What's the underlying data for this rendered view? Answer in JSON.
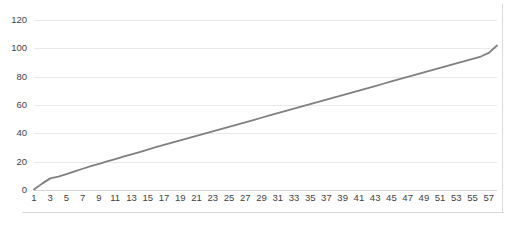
{
  "chart_data": {
    "type": "line",
    "title": "",
    "subtitle": "",
    "xlabel": "",
    "ylabel": "",
    "grid": true,
    "legend": false,
    "legend_position": "none",
    "ylim": [
      0,
      120
    ],
    "yticks": [
      0,
      20,
      40,
      60,
      80,
      100,
      120
    ],
    "ytick_labels": [
      "0",
      "20",
      "40",
      "60",
      "80",
      "100",
      "120"
    ],
    "xlim": [
      1,
      58
    ],
    "xticks": [
      1,
      3,
      5,
      7,
      9,
      11,
      13,
      15,
      17,
      19,
      21,
      23,
      25,
      27,
      29,
      31,
      33,
      35,
      37,
      39,
      41,
      43,
      45,
      47,
      49,
      51,
      53,
      55,
      57
    ],
    "xtick_labels": [
      "1",
      "3",
      "5",
      "7",
      "9",
      "11",
      "13",
      "15",
      "17",
      "19",
      "21",
      "23",
      "25",
      "27",
      "29",
      "31",
      "33",
      "35",
      "37",
      "39",
      "41",
      "43",
      "45",
      "47",
      "49",
      "51",
      "53",
      "55",
      "57"
    ],
    "series": [
      {
        "name": "Series 1",
        "color": "#808080",
        "line_width": 1.8,
        "markers": false,
        "x": [
          1,
          2,
          3,
          4,
          5,
          6,
          7,
          8,
          9,
          10,
          11,
          12,
          13,
          14,
          15,
          16,
          17,
          18,
          19,
          20,
          21,
          22,
          23,
          24,
          25,
          26,
          27,
          28,
          29,
          30,
          31,
          32,
          33,
          34,
          35,
          36,
          37,
          38,
          39,
          40,
          41,
          42,
          43,
          44,
          45,
          46,
          47,
          48,
          49,
          50,
          51,
          52,
          53,
          54,
          55,
          56,
          57,
          58
        ],
        "values": [
          0.3,
          4.5,
          8.2,
          9.5,
          11.2,
          13.2,
          15.0,
          16.8,
          18.5,
          20.2,
          21.8,
          23.5,
          25.2,
          26.8,
          28.5,
          30.2,
          31.8,
          33.4,
          35.0,
          36.6,
          38.2,
          39.8,
          41.4,
          43.0,
          44.6,
          46.2,
          47.8,
          49.4,
          51.0,
          52.6,
          54.2,
          55.8,
          57.4,
          59.0,
          60.6,
          62.2,
          63.8,
          65.4,
          67.0,
          68.6,
          70.2,
          71.8,
          73.4,
          75.0,
          76.6,
          78.2,
          79.8,
          81.4,
          83.0,
          84.6,
          86.2,
          87.8,
          89.4,
          91.0,
          92.6,
          94.2,
          96.8,
          102.0
        ]
      }
    ],
    "colors": {
      "line": "#808080",
      "gridline": "#e9e9e9",
      "axis": "#d6d6d6",
      "frame": "#d9d9d9",
      "tick_text": "#3f3f3f",
      "background": "#ffffff"
    }
  }
}
